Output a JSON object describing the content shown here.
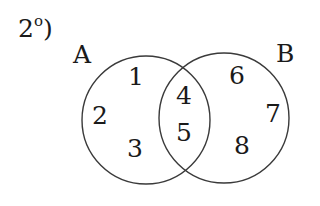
{
  "question": {
    "number": "2",
    "ordinal": "o",
    "close": ")"
  },
  "sets": [
    {
      "name": "A",
      "cx": 146,
      "cy": 120,
      "r": 64
    },
    {
      "name": "B",
      "cx": 224,
      "cy": 118,
      "r": 65
    }
  ],
  "regions": {
    "only_A": [
      "1",
      "2",
      "3"
    ],
    "A_and_B": [
      "4",
      "5"
    ],
    "only_B": [
      "6",
      "7",
      "8"
    ]
  },
  "colors": {
    "stroke": "#3a3a3a",
    "text": "#1a1a1a",
    "background": "#ffffff"
  }
}
